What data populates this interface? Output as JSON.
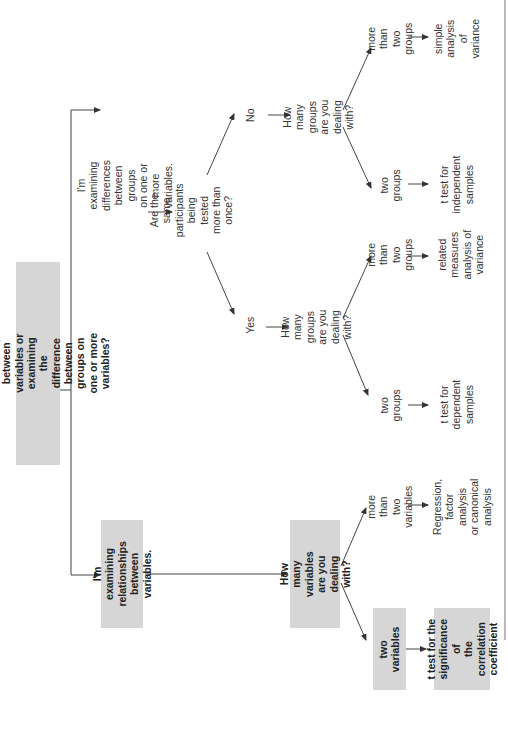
{
  "diagram": {
    "root": {
      "text": "Are you examining relationships between\nvariables or examining the difference between\ngroups on one or more variables?"
    },
    "branch_differences": {
      "text": "I'm examining differences\nbetween groups\non one or more variables.",
      "question": "Are the same participants\nbeing tested more than once?",
      "yes": {
        "label": "Yes",
        "question": "How many\ngroups are you\ndealing with?",
        "two": {
          "label": "two\ngroups",
          "result": "t test for\ndependent\nsamples"
        },
        "more": {
          "label": "more than\ntwo groups",
          "result": "related\nmeasures\nanalysis of\nvariance"
        }
      },
      "no": {
        "label": "No",
        "question": "How many\ngroups are you\ndealing with?",
        "two": {
          "label": "two\ngroups",
          "result": "t test for\nindependent\nsamples"
        },
        "more": {
          "label": "more than\ntwo groups",
          "result": "simple\nanalysis of\nvariance"
        }
      }
    },
    "branch_relationships": {
      "text": "I'm examining\nrelationships\nbetween variables.",
      "question": "How many\nvariables are you\ndealing with?",
      "two": {
        "label": "two\nvariables",
        "result": "t test for the\nsignificance of\nthe correlation\ncoefficient"
      },
      "more": {
        "label": "more than\ntwo variables",
        "result": "Regression,\nfactor analysis\nor canonical\nanalysis"
      }
    },
    "colors": {
      "box_fill": "#d6d6d6",
      "line": "#333333",
      "text": "#2a2a2a"
    }
  }
}
